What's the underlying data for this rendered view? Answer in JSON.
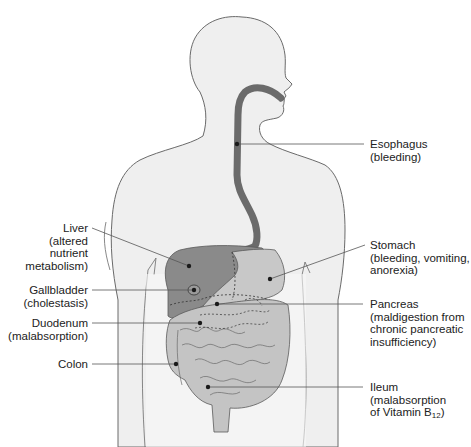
{
  "colors": {
    "body_fill": "#efefef",
    "body_stroke": "#6a6a6a",
    "esophagus": "#6b6b6b",
    "liver": "#8a8a8a",
    "stomach": "#c8c8c8",
    "intestine": "#c4c4c4",
    "marker": "#1a1a1a",
    "leader": "#555555"
  },
  "labels": {
    "esophagus": {
      "name": "Esophagus",
      "detail": [
        "(bleeding)"
      ]
    },
    "liver": {
      "name": "Liver",
      "detail": [
        "(altered",
        "nutrient",
        "metabolism)"
      ]
    },
    "stomach": {
      "name": "Stomach",
      "detail": [
        "(bleeding, vomiting,",
        "anorexia)"
      ]
    },
    "gallbladder": {
      "name": "Gallbladder",
      "detail": [
        "(cholestasis)"
      ]
    },
    "pancreas": {
      "name": "Pancreas",
      "detail": [
        "(maldigestion from",
        "chronic pancreatic",
        "insufficiency)"
      ]
    },
    "duodenum": {
      "name": "Duodenum",
      "detail": [
        "(malabsorption)"
      ]
    },
    "colon": {
      "name": "Colon",
      "detail": []
    },
    "ileum": {
      "name": "Ileum",
      "detail": [
        "(malabsorption",
        "of Vitamin B"
      ],
      "subscript": "12",
      "closing": ")"
    }
  }
}
